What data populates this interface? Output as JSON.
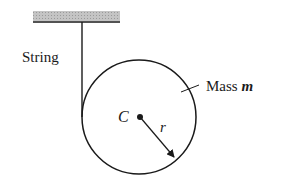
{
  "diagram": {
    "labels": {
      "string": "String",
      "mass": "Mass ",
      "mass_symbol": "m",
      "center": "C",
      "radius": "r"
    },
    "colors": {
      "ink": "#1a1a1a",
      "ceiling_fill": "#b8b8b8"
    }
  }
}
